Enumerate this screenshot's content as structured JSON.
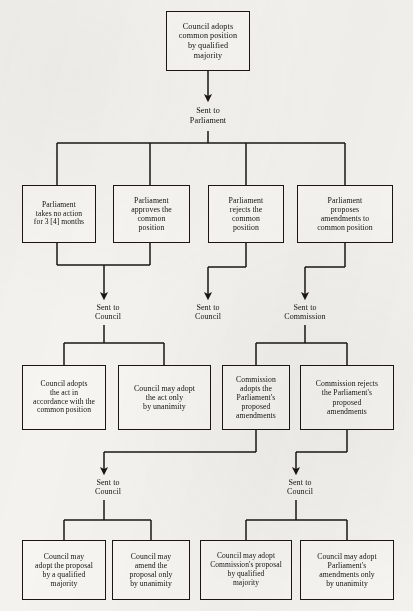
{
  "diagram": {
    "type": "flowchart",
    "line_color": "#1a1713",
    "box_fill": "#f6f5f2",
    "background": "#f3f2ef",
    "nodes": [
      {
        "id": "n0",
        "text": "Council adopts\ncommon position\nby qualified\nmajority",
        "x": 166,
        "y": 11,
        "w": 84,
        "h": 60,
        "font_size": 8.2
      },
      {
        "id": "n1",
        "text": "Parliament\ntakes no action\nfor 3 [4] months",
        "x": 22,
        "y": 185,
        "w": 74,
        "h": 58,
        "font_size": 7.6
      },
      {
        "id": "n2",
        "text": "Parliament\napproves the\ncommon\nposition",
        "x": 113,
        "y": 185,
        "w": 77,
        "h": 58,
        "font_size": 7.8
      },
      {
        "id": "n3",
        "text": "Parliament\nrejects the\ncommon\nposition",
        "x": 208,
        "y": 185,
        "w": 76,
        "h": 58,
        "font_size": 7.8
      },
      {
        "id": "n4",
        "text": "Parliament\nproposes\namendments to\ncommon position",
        "x": 297,
        "y": 185,
        "w": 96,
        "h": 58,
        "font_size": 7.8
      },
      {
        "id": "n5",
        "text": "Council adopts\nthe act in\naccordance with the\ncommon position",
        "x": 22,
        "y": 365,
        "w": 84,
        "h": 65,
        "font_size": 7.6
      },
      {
        "id": "n6",
        "text": "Council may adopt\nthe act only\nby unanimity",
        "x": 118,
        "y": 365,
        "w": 93,
        "h": 65,
        "font_size": 7.9
      },
      {
        "id": "n7",
        "text": "Commission\nadopts the\nParliament's\nproposed\namendments",
        "x": 222,
        "y": 365,
        "w": 68,
        "h": 65,
        "font_size": 7.7
      },
      {
        "id": "n8",
        "text": "Commission rejects\nthe Parliament's\nproposed\namendments",
        "x": 300,
        "y": 365,
        "w": 94,
        "h": 65,
        "font_size": 7.7
      },
      {
        "id": "n9",
        "text": "Council may\nadopt the proposal\nby a qualified\nmajority",
        "x": 22,
        "y": 540,
        "w": 84,
        "h": 60,
        "font_size": 7.7
      },
      {
        "id": "n10",
        "text": "Council may\namend the\nproposal only\nby unanimity",
        "x": 112,
        "y": 540,
        "w": 78,
        "h": 60,
        "font_size": 7.7
      },
      {
        "id": "n11",
        "text": "Council may adopt\nCommission's proposal\nby qualified\nmajority",
        "x": 200,
        "y": 540,
        "w": 92,
        "h": 60,
        "font_size": 7.5
      },
      {
        "id": "n12",
        "text": "Council may adopt\nParliament's\namendments only\nby unanimity",
        "x": 300,
        "y": 540,
        "w": 94,
        "h": 60,
        "font_size": 7.7
      }
    ],
    "edge_labels": [
      {
        "id": "l0",
        "text": "Sent to\nParliament",
        "x": 168,
        "y": 106,
        "w": 80,
        "font_size": 8.2
      },
      {
        "id": "l1",
        "text": "Sent to\nCouncil",
        "x": 68,
        "y": 303,
        "w": 80,
        "font_size": 8.0
      },
      {
        "id": "l2",
        "text": "Sent to\nCouncil",
        "x": 168,
        "y": 303,
        "w": 80,
        "font_size": 8.0
      },
      {
        "id": "l3",
        "text": "Sent to\nCommission",
        "x": 255,
        "y": 303,
        "w": 100,
        "font_size": 8.0
      },
      {
        "id": "l4",
        "text": "Sent to\nCouncil",
        "x": 68,
        "y": 478,
        "w": 80,
        "font_size": 8.0
      },
      {
        "id": "l5",
        "text": "Sent to\nCouncil",
        "x": 260,
        "y": 478,
        "w": 80,
        "font_size": 8.0
      }
    ],
    "connectors": [
      {
        "id": "c-top-arrow",
        "kind": "arrow",
        "path": "M 208 71 L 208 98"
      },
      {
        "id": "c-parliament-stem",
        "kind": "line",
        "path": "M 208 131 L 208 143"
      },
      {
        "id": "c-parliament-fan",
        "kind": "line",
        "path": "M 57 143 L 345 143"
      },
      {
        "id": "c-fan-drop-1",
        "kind": "line",
        "path": "M 57 143 L 57 185"
      },
      {
        "id": "c-fan-drop-2",
        "kind": "line",
        "path": "M 150 143 L 150 185"
      },
      {
        "id": "c-fan-drop-3",
        "kind": "line",
        "path": "M 246 143 L 246 185"
      },
      {
        "id": "c-fan-drop-4",
        "kind": "line",
        "path": "M 345 143 L 345 185"
      },
      {
        "id": "c-n1-down",
        "kind": "line",
        "path": "M 57 243 L 57 265"
      },
      {
        "id": "c-n2-down",
        "kind": "line",
        "path": "M 150 243 L 150 265"
      },
      {
        "id": "c-merge-12",
        "kind": "line",
        "path": "M 57 265 L 150 265"
      },
      {
        "id": "c-merge-12-arrow",
        "kind": "arrow",
        "path": "M 104 265 L 104 296"
      },
      {
        "id": "c-n3-down",
        "kind": "line",
        "path": "M 246 243 L 246 267"
      },
      {
        "id": "c-n3-jog",
        "kind": "line",
        "path": "M 246 267 L 208 267"
      },
      {
        "id": "c-n3-arrow",
        "kind": "arrow",
        "path": "M 208 267 L 208 296"
      },
      {
        "id": "c-n4-down",
        "kind": "line",
        "path": "M 345 243 L 345 267"
      },
      {
        "id": "c-n4-jog",
        "kind": "line",
        "path": "M 345 267 L 305 267"
      },
      {
        "id": "c-n4-arrow",
        "kind": "arrow",
        "path": "M 305 267 L 305 296"
      },
      {
        "id": "c-l1-drop",
        "kind": "line",
        "path": "M 104 325 L 104 343"
      },
      {
        "id": "c-l1-fan",
        "kind": "line",
        "path": "M 64 343 L 164 343"
      },
      {
        "id": "c-l1-fan-a",
        "kind": "line",
        "path": "M 64 343 L 64 365"
      },
      {
        "id": "c-l1-fan-b",
        "kind": "line",
        "path": "M 164 343 L 164 365"
      },
      {
        "id": "c-l3-drop",
        "kind": "line",
        "path": "M 305 325 L 305 343"
      },
      {
        "id": "c-l3-fan",
        "kind": "line",
        "path": "M 256 343 L 347 343"
      },
      {
        "id": "c-l3-fan-a",
        "kind": "line",
        "path": "M 256 343 L 256 365"
      },
      {
        "id": "c-l3-fan-b",
        "kind": "line",
        "path": "M 347 343 L 347 365"
      },
      {
        "id": "c-n7-down",
        "kind": "line",
        "path": "M 256 430 L 256 452"
      },
      {
        "id": "c-n7-jog",
        "kind": "line",
        "path": "M 256 452 L 104 452"
      },
      {
        "id": "c-n7-arrow",
        "kind": "arrow",
        "path": "M 104 452 L 104 471"
      },
      {
        "id": "c-n8-down",
        "kind": "line",
        "path": "M 347 430 L 347 452"
      },
      {
        "id": "c-n8-jog",
        "kind": "line",
        "path": "M 347 452 L 296 452"
      },
      {
        "id": "c-n8-arrow",
        "kind": "arrow",
        "path": "M 296 452 L 296 471"
      },
      {
        "id": "c-l4-drop",
        "kind": "line",
        "path": "M 104 500 L 104 520"
      },
      {
        "id": "c-l4-fan",
        "kind": "line",
        "path": "M 64 520 L 151 520"
      },
      {
        "id": "c-l4-fan-a",
        "kind": "line",
        "path": "M 64 520 L 64 540"
      },
      {
        "id": "c-l4-fan-b",
        "kind": "line",
        "path": "M 151 520 L 151 540"
      },
      {
        "id": "c-l5-drop",
        "kind": "line",
        "path": "M 296 500 L 296 520"
      },
      {
        "id": "c-l5-fan",
        "kind": "line",
        "path": "M 246 520 L 347 520"
      },
      {
        "id": "c-l5-fan-a",
        "kind": "line",
        "path": "M 246 520 L 246 540"
      },
      {
        "id": "c-l5-fan-b",
        "kind": "line",
        "path": "M 347 520 L 347 540"
      }
    ]
  }
}
